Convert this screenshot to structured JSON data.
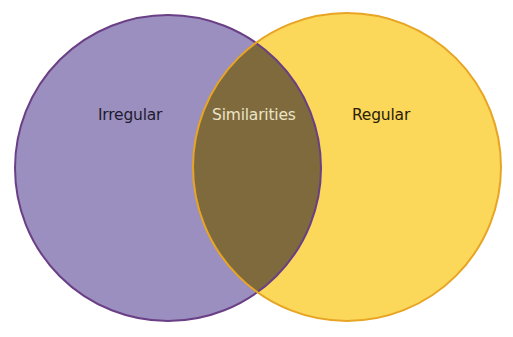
{
  "diagram": {
    "type": "venn",
    "sets": [
      {
        "id": "left",
        "label": "Irregular",
        "fill": "#9b8fbf",
        "stroke": "#6a3f86"
      },
      {
        "id": "right",
        "label": "Regular",
        "fill": "#fbd75a",
        "stroke": "#e8a423"
      }
    ],
    "intersection": {
      "label": "Similarities",
      "fill": "#7e6a3c",
      "text_color": "#ece4c8"
    }
  }
}
